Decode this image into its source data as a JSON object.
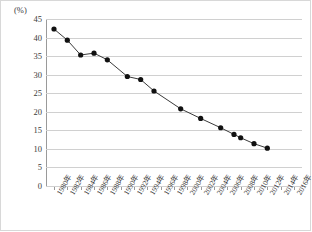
{
  "chart_data": {
    "type": "line",
    "title": "",
    "subtitle": "",
    "xlabel": "",
    "ylabel": "",
    "unit_label": "(%)",
    "ylim": [
      0,
      45
    ],
    "ytick_step": 5,
    "ytick_labels": [
      "0",
      "5",
      "10",
      "15",
      "20",
      "25",
      "30",
      "35",
      "40",
      "45"
    ],
    "grid": true,
    "legend": "none",
    "xtick_labels": [
      "1980年",
      "1982年",
      "1984年",
      "1986年",
      "1988年",
      "1990年",
      "1992年",
      "1994年",
      "1996年",
      "1998年",
      "2000年",
      "2002年",
      "2004年",
      "2006年",
      "2008年",
      "2010年",
      "2012年",
      "2014年",
      "2016年"
    ],
    "xlim": [
      1980,
      2016
    ],
    "series": [
      {
        "name": "",
        "marker": "filled-circle",
        "color": "#1a1a1a",
        "x": [
          1980,
          1982,
          1984,
          1986,
          1988,
          1990,
          1992,
          1994,
          1996,
          1998,
          2000,
          2002,
          2004,
          2006,
          2008,
          2010,
          2011,
          2012,
          2013,
          2014,
          2016
        ],
        "values": [
          42.3,
          39.3,
          35.3,
          35.8,
          34.0,
          29.5,
          28.7,
          25.6,
          20.8,
          18.2,
          15.7,
          13.9,
          13.0,
          11.4,
          10.2,
          null,
          null,
          null,
          null,
          null,
          null
        ]
      }
    ],
    "points": [
      {
        "x": 1980,
        "y": 42.3
      },
      {
        "x": 1982,
        "y": 39.3
      },
      {
        "x": 1984,
        "y": 35.3
      },
      {
        "x": 1986,
        "y": 35.8
      },
      {
        "x": 1988,
        "y": 34.0
      },
      {
        "x": 1991,
        "y": 29.5
      },
      {
        "x": 1993,
        "y": 28.7
      },
      {
        "x": 1995,
        "y": 25.6
      },
      {
        "x": 1999,
        "y": 20.8
      },
      {
        "x": 2002,
        "y": 18.2
      },
      {
        "x": 2005,
        "y": 15.7
      },
      {
        "x": 2007,
        "y": 13.9
      },
      {
        "x": 2008,
        "y": 13.0
      },
      {
        "x": 2010,
        "y": 11.4
      },
      {
        "x": 2012,
        "y": 10.2
      }
    ]
  },
  "colors": {
    "line": "#3a3a3a",
    "marker": "#111111",
    "grid": "#d0d0d0",
    "axis": "#9a9a9a",
    "text": "#3a3a3a",
    "frame": "#d8d8d8",
    "background": "#ffffff"
  }
}
